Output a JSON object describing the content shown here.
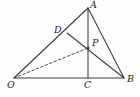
{
  "figure": {
    "type": "geometry-diagram",
    "width": 140,
    "height": 97,
    "background_color": "#fefefe",
    "stroke_color": "#3a3a3a",
    "label_color": "#1b1b1b",
    "points": [
      {
        "id": "A",
        "label": "A",
        "x": 88,
        "y": 8,
        "label_x": 90,
        "label_y": 0,
        "marked": false
      },
      {
        "id": "D",
        "label": "D",
        "x": 67,
        "y": 33,
        "label_x": 54,
        "label_y": 25,
        "marked": false
      },
      {
        "id": "P",
        "label": "P",
        "x": 88,
        "y": 48,
        "label_x": 92,
        "label_y": 38,
        "marked": true
      },
      {
        "id": "O",
        "label": "O",
        "x": 14,
        "y": 78,
        "label_x": 7,
        "label_y": 80,
        "marked": false
      },
      {
        "id": "C",
        "label": "C",
        "x": 88,
        "y": 78,
        "label_x": 84,
        "label_y": 80,
        "marked": false
      },
      {
        "id": "B",
        "label": "B",
        "x": 124,
        "y": 78,
        "label_x": 127,
        "label_y": 74,
        "marked": false
      }
    ],
    "segments": [
      {
        "id": "OA",
        "from": "O",
        "to": "A",
        "style": "solid"
      },
      {
        "id": "AB",
        "from": "A",
        "to": "B",
        "style": "solid"
      },
      {
        "id": "OB",
        "from": "O",
        "to": "B",
        "style": "solid"
      },
      {
        "id": "AC",
        "from": "A",
        "to": "C",
        "style": "solid"
      },
      {
        "id": "DB",
        "from": "D",
        "to": "B",
        "style": "solid"
      },
      {
        "id": "OP",
        "from": "O",
        "to": "P",
        "style": "dashed"
      }
    ]
  }
}
